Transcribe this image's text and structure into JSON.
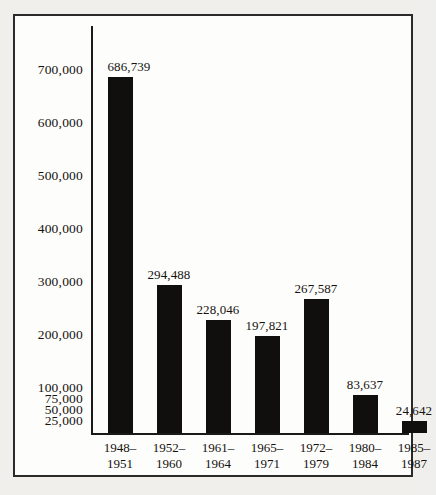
{
  "chart_data": {
    "type": "bar",
    "title": "",
    "subtitle": "",
    "xlabel": "",
    "ylabel": "",
    "categories": [
      "1948-1951",
      "1952-1960",
      "1961-1964",
      "1965-1971",
      "1972-1979",
      "1980-1984",
      "1985-1987"
    ],
    "category_lines": [
      [
        "1948–",
        "1951"
      ],
      [
        "1952–",
        "1960"
      ],
      [
        "1961–",
        "1964"
      ],
      [
        "1965–",
        "1971"
      ],
      [
        "1972–",
        "1979"
      ],
      [
        "1980–",
        "1984"
      ],
      [
        "1985–",
        "1987"
      ]
    ],
    "values": [
      686739,
      294488,
      228046,
      197821,
      267587,
      83637,
      24642
    ],
    "value_labels": [
      "686,739",
      "294,488",
      "228,046",
      "197,821",
      "267,587",
      "83,637",
      "24,642"
    ],
    "ytick_labels": [
      "700,000",
      "600,000",
      "500,000",
      "400,000",
      "300,000",
      "200,000",
      "100,000",
      "75,000",
      "50,000",
      "25,000"
    ],
    "ytick_values": [
      700000,
      600000,
      500000,
      400000,
      300000,
      200000,
      100000,
      75000,
      50000,
      25000
    ],
    "ylim": [
      0,
      700000
    ],
    "axis_note": "compressed (broken) scale below 100,000",
    "grid": false,
    "legend": null,
    "colors": {
      "bar": "#100f0d",
      "axis": "#1a1a1a",
      "frame": "#2a2a2a",
      "text": "#15120f",
      "plot_background": "#fdfdfb",
      "page_background": "#efefed"
    }
  }
}
